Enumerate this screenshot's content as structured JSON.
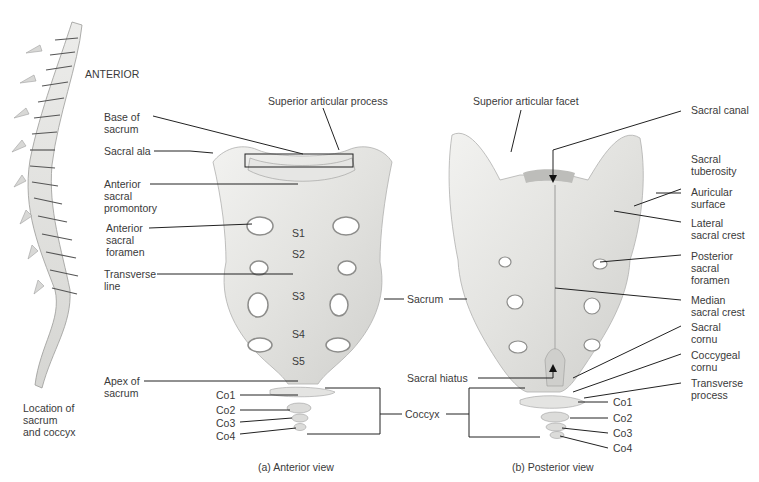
{
  "figure": {
    "orientation_label": "ANTERIOR",
    "location_caption": [
      "Location of",
      "sacrum",
      "and coccyx"
    ],
    "panel_a": {
      "caption": "(a) Anterior view",
      "labels": {
        "superior_articular_process": "Superior articular process",
        "base_of_sacrum": [
          "Base of",
          "sacrum"
        ],
        "sacral_ala": "Sacral ala",
        "anterior_sacral_promontory": [
          "Anterior",
          "sacral",
          "promontory"
        ],
        "anterior_sacral_foramen": [
          "Anterior",
          "sacral",
          "foramen"
        ],
        "transverse_line": [
          "Transverse",
          "line"
        ],
        "apex_of_sacrum": [
          "Apex of",
          "sacrum"
        ],
        "segments": [
          "S1",
          "S2",
          "S3",
          "S4",
          "S5"
        ],
        "coccygeal": [
          "Co1",
          "Co2",
          "Co3",
          "Co4"
        ]
      }
    },
    "shared": {
      "sacrum": "Sacrum",
      "coccyx": "Coccyx"
    },
    "panel_b": {
      "caption": "(b) Posterior view",
      "labels": {
        "superior_articular_facet": "Superior articular facet",
        "sacral_canal": "Sacral canal",
        "sacral_tuberosity": [
          "Sacral",
          "tuberosity"
        ],
        "auricular_surface": [
          "Auricular",
          "surface"
        ],
        "lateral_sacral_crest": [
          "Lateral",
          "sacral crest"
        ],
        "posterior_sacral_foramen": [
          "Posterior",
          "sacral",
          "foramen"
        ],
        "median_sacral_crest": [
          "Median",
          "sacral crest"
        ],
        "sacral_cornu": [
          "Sacral",
          "cornu"
        ],
        "coccygeal_cornu": [
          "Coccygeal",
          "cornu"
        ],
        "transverse_process": [
          "Transverse",
          "process"
        ],
        "sacral_hiatus": "Sacral hiatus",
        "coccygeal": [
          "Co1",
          "Co2",
          "Co3",
          "Co4"
        ]
      }
    }
  }
}
